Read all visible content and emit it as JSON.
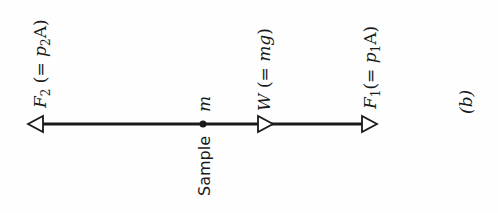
{
  "diagram": {
    "panel_label": "(b)",
    "sample_label": "Sample",
    "mass_symbol": "m",
    "forces": [
      {
        "id": "F2",
        "symbol": "F",
        "subscript": "2",
        "eq_open": " (= ",
        "p": "p",
        "p_sub": "2",
        "area": "A",
        "eq_close": ")",
        "direction": "left"
      },
      {
        "id": "W",
        "symbol": "W",
        "eq_open": " (= ",
        "expr": "mg",
        "eq_close": ")",
        "direction": "right"
      },
      {
        "id": "F1",
        "symbol": "F",
        "subscript": "1",
        "eq_open": "(= ",
        "p": "p",
        "p_sub": "1",
        "area": "A",
        "eq_close": ")",
        "direction": "right"
      }
    ],
    "colors": {
      "line": "#1a1a1a",
      "background": "#fefefe"
    }
  }
}
